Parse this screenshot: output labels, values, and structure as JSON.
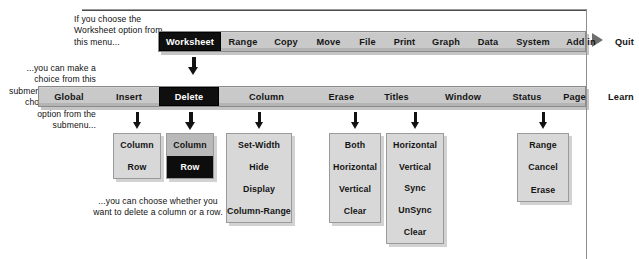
{
  "notes": {
    "top": "If you choose the Worksheet option from this menu...",
    "left": "...you can make a choice from this submenu. Then, if you choose the Delete option from the submenu...",
    "bottom": "...you can choose whether you want to delete a column or a row."
  },
  "colors": {
    "selected_bg": "#100f0f",
    "selected_fg": "#ffffff",
    "bar_bg": "#c9c9c9",
    "box_bg": "#d8d8d8",
    "box_bg_dark": "#b9b9b9",
    "arrow": "#121212",
    "marker": "#6f6f6f"
  },
  "menubar1": {
    "name": "main-menu",
    "items": [
      {
        "label": "Worksheet",
        "selected": true,
        "width": 62
      },
      {
        "label": "Range",
        "selected": false,
        "width": 44
      },
      {
        "label": "Copy",
        "selected": false,
        "width": 42
      },
      {
        "label": "Move",
        "selected": false,
        "width": 43
      },
      {
        "label": "File",
        "selected": false,
        "width": 35
      },
      {
        "label": "Print",
        "selected": false,
        "width": 39
      },
      {
        "label": "Graph",
        "selected": false,
        "width": 44
      },
      {
        "label": "Data",
        "selected": false,
        "width": 40
      },
      {
        "label": "System",
        "selected": false,
        "width": 50
      },
      {
        "label": "Add in",
        "selected": false,
        "width": 46
      },
      {
        "label": "Quit",
        "selected": false,
        "width": 41
      }
    ]
  },
  "menubar2": {
    "name": "worksheet-submenu",
    "items": [
      {
        "label": "Global",
        "selected": false,
        "width": 60
      },
      {
        "label": "Insert",
        "selected": false,
        "width": 60
      },
      {
        "label": "Delete",
        "selected": true,
        "width": 60
      },
      {
        "label": "Column",
        "selected": false,
        "width": 95
      },
      {
        "label": "Erase",
        "selected": false,
        "width": 55
      },
      {
        "label": "Titles",
        "selected": false,
        "width": 55
      },
      {
        "label": "Window",
        "selected": false,
        "width": 78
      },
      {
        "label": "Status",
        "selected": false,
        "width": 50
      },
      {
        "label": "Page",
        "selected": false,
        "width": 45
      },
      {
        "label": "Learn",
        "selected": false,
        "width": 48
      }
    ]
  },
  "option_boxes": [
    {
      "id": "insert",
      "parent": "Insert",
      "dark": false,
      "options": [
        {
          "label": "Column",
          "selected": false
        },
        {
          "label": "Row",
          "selected": false
        }
      ]
    },
    {
      "id": "delete",
      "parent": "Delete",
      "dark": true,
      "options": [
        {
          "label": "Column",
          "selected": false
        },
        {
          "label": "Row",
          "selected": true
        }
      ]
    },
    {
      "id": "column",
      "parent": "Column",
      "dark": false,
      "options": [
        {
          "label": "Set-Width",
          "selected": false
        },
        {
          "label": "Hide",
          "selected": false
        },
        {
          "label": "Display",
          "selected": false
        },
        {
          "label": "Column-Range",
          "selected": false
        }
      ]
    },
    {
      "id": "erase",
      "parent": "Titles",
      "dark": false,
      "options": [
        {
          "label": "Both",
          "selected": false
        },
        {
          "label": "Horizontal",
          "selected": false
        },
        {
          "label": "Vertical",
          "selected": false
        },
        {
          "label": "Clear",
          "selected": false
        }
      ]
    },
    {
      "id": "window",
      "parent": "Window",
      "dark": false,
      "options": [
        {
          "label": "Horizontal",
          "selected": false
        },
        {
          "label": "Vertical",
          "selected": false
        },
        {
          "label": "Sync",
          "selected": false
        },
        {
          "label": "UnSync",
          "selected": false
        },
        {
          "label": "Clear",
          "selected": false
        }
      ]
    },
    {
      "id": "learn",
      "parent": "Learn",
      "dark": false,
      "options": [
        {
          "label": "Range",
          "selected": false
        },
        {
          "label": "Cancel",
          "selected": false
        },
        {
          "label": "Erase",
          "selected": false
        }
      ]
    }
  ],
  "arrows": [
    {
      "name": "arrow-worksheet-to-submenu",
      "x": 188,
      "y": 57,
      "bold": true
    },
    {
      "name": "arrow-to-insert-box",
      "x": 133,
      "y": 112,
      "bold": false
    },
    {
      "name": "arrow-to-delete-box",
      "x": 185,
      "y": 112,
      "bold": true
    },
    {
      "name": "arrow-to-column-box",
      "x": 255,
      "y": 112,
      "bold": false
    },
    {
      "name": "arrow-to-titles-box",
      "x": 351,
      "y": 112,
      "bold": false
    },
    {
      "name": "arrow-to-window-box",
      "x": 411,
      "y": 112,
      "bold": false
    },
    {
      "name": "arrow-to-learn-box",
      "x": 539,
      "y": 112,
      "bold": false
    }
  ],
  "marker": {
    "name": "play-marker",
    "shape": "right-triangle"
  }
}
